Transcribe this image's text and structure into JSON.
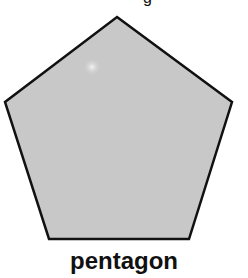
{
  "diagram": {
    "top_fragment": "g",
    "shape": {
      "name": "pentagon",
      "fill": "#c8c8c8",
      "stroke": "#111111",
      "vertices": [
        [
          117,
          17
        ],
        [
          232,
          102
        ],
        [
          189,
          239
        ],
        [
          49,
          239
        ],
        [
          5,
          102
        ]
      ]
    },
    "label": "pentagon"
  }
}
